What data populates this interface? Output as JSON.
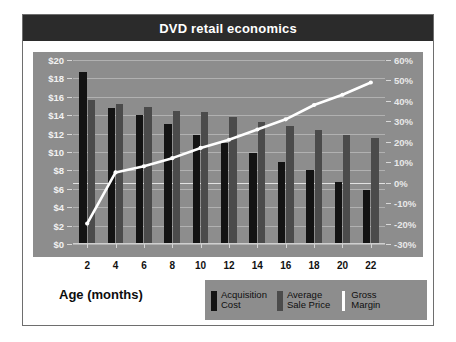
{
  "figure": {
    "title": "DVD retail economics",
    "axis_title": "Age (months)"
  },
  "legend": {
    "items": [
      {
        "label_line1": "Acquisition",
        "label_line2": "Cost",
        "swatch": "cost",
        "color": "#131313"
      },
      {
        "label_line1": "Average",
        "label_line2": "Sale Price",
        "swatch": "price",
        "color": "#4b4b4b"
      },
      {
        "label_line1": "Gross",
        "label_line2": "Margin",
        "swatch": "margin",
        "color": "#ffffff"
      }
    ]
  },
  "colors": {
    "title_bar": "#2b2b2b",
    "panel_background": "#8d8d8d",
    "acquisition_cost": "#131313",
    "average_sale_price": "#4b4b4b",
    "gross_margin_line": "#ffffff",
    "page_background": "#ffffff",
    "frame_border": "#6e6e6e"
  },
  "chart_data": {
    "type": "bar",
    "title": "DVD retail economics",
    "xlabel": "Age (months)",
    "ylabel": "",
    "categories": [
      "2",
      "4",
      "6",
      "8",
      "10",
      "12",
      "14",
      "16",
      "18",
      "20",
      "22"
    ],
    "x": [
      2,
      4,
      6,
      8,
      10,
      12,
      14,
      16,
      18,
      20,
      22
    ],
    "grid": true,
    "legend_position": "bottom-right",
    "axes": {
      "left": {
        "label": "",
        "ylim": [
          0,
          20
        ],
        "tick_step": 2,
        "tick_labels": [
          "$0",
          "$2",
          "$4",
          "$6",
          "$8",
          "$10",
          "$12",
          "$14",
          "$16",
          "$18",
          "$20"
        ],
        "tick_values": [
          0,
          2,
          4,
          6,
          8,
          10,
          12,
          14,
          16,
          18,
          20
        ]
      },
      "right": {
        "label": "",
        "ylim": [
          -30,
          60
        ],
        "tick_step": 10,
        "tick_labels": [
          "-30%",
          "-20%",
          "-10%",
          "0%",
          "10%",
          "20%",
          "30%",
          "40%",
          "50%",
          "60%"
        ],
        "tick_values": [
          -30,
          -20,
          -10,
          0,
          10,
          20,
          30,
          40,
          50,
          60
        ]
      }
    },
    "series": [
      {
        "name": "Acquisition Cost",
        "type": "bar",
        "axis": "left",
        "unit": "$",
        "color": "#131313",
        "values": [
          18.7,
          14.8,
          14.0,
          13.0,
          11.8,
          11.0,
          9.9,
          8.9,
          8.0,
          6.7,
          5.9
        ]
      },
      {
        "name": "Average Sale Price",
        "type": "bar",
        "axis": "left",
        "unit": "$",
        "color": "#4b4b4b",
        "values": [
          15.7,
          15.2,
          14.9,
          14.5,
          14.3,
          13.8,
          13.3,
          12.8,
          12.4,
          11.9,
          11.5
        ]
      },
      {
        "name": "Gross Margin",
        "type": "line",
        "axis": "right",
        "unit": "%",
        "color": "#ffffff",
        "values": [
          -20,
          5,
          8,
          12,
          17,
          21,
          26,
          31,
          38,
          43,
          49
        ]
      }
    ]
  }
}
